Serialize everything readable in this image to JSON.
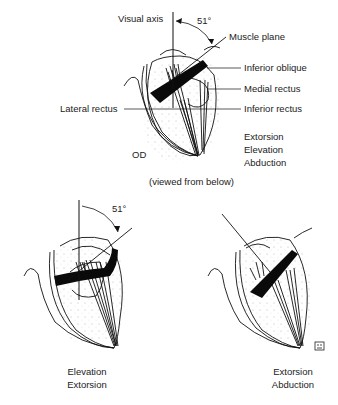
{
  "top_figure": {
    "visual_axis_label": "Visual axis",
    "angle_label": "51°",
    "muscle_plane_label": "Muscle plane",
    "inferior_oblique_label": "Inferior oblique",
    "medial_rectus_label": "Medial rectus",
    "lateral_rectus_label": "Lateral rectus",
    "inferior_rectus_label": "Inferior rectus",
    "eye_label": "OD",
    "actions": [
      "Extorsion",
      "Elevation",
      "Abduction"
    ],
    "caption": "(viewed from below)"
  },
  "bottom_left_figure": {
    "angle_label": "51°",
    "actions": [
      "Elevation",
      "Extorsion"
    ]
  },
  "bottom_right_figure": {
    "actions": [
      "Extorsion",
      "Abduction"
    ],
    "badge_icon": "publisher-logo-icon"
  }
}
